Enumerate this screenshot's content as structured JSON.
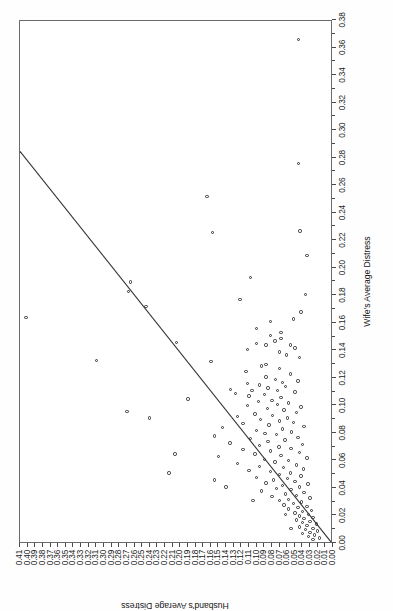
{
  "figure": {
    "background_color": "#ffffff",
    "frame_color": "#6b6b6b",
    "point_color": "#2e2e2e",
    "line_color": "#333333",
    "orientation_note": "chart printed rotated 90 degrees counter-clockwise on portrait page"
  },
  "chart_data": {
    "type": "scatter",
    "title": "",
    "xlabel": "Wife's Average Distress",
    "ylabel": "Husband's Average Distress",
    "xlim": [
      0.0,
      0.38
    ],
    "ylim": [
      0.0,
      0.41
    ],
    "grid": false,
    "legend": null,
    "xticks": [
      "0.00",
      "0.02",
      "0.04",
      "0.06",
      "0.08",
      "0.10",
      "0.12",
      "0.14",
      "0.16",
      "0.18",
      "0.20",
      "0.22",
      "0.24",
      "0.26",
      "0.28",
      "0.30",
      "0.32",
      "0.34",
      "0.36",
      "0.38"
    ],
    "xtick_values": [
      0.0,
      0.02,
      0.04,
      0.06,
      0.08,
      0.1,
      0.12,
      0.14,
      0.16,
      0.18,
      0.2,
      0.22,
      0.24,
      0.26,
      0.28,
      0.3,
      0.32,
      0.34,
      0.36,
      0.38
    ],
    "xtick_minor_values": [
      0.01,
      0.03,
      0.05,
      0.07,
      0.09,
      0.11,
      0.13,
      0.15,
      0.17,
      0.19,
      0.21,
      0.23,
      0.25,
      0.27,
      0.29,
      0.31,
      0.33,
      0.35,
      0.37
    ],
    "yticks": [
      "0.00",
      "0.01",
      "0.02",
      "0.03",
      "0.04",
      "0.05",
      "0.06",
      "0.07",
      "0.08",
      "0.09",
      "0.10",
      "0.11",
      "0.12",
      "0.13",
      "0.14",
      "0.15",
      "0.16",
      "0.17",
      "0.18",
      "0.19",
      "0.20",
      "0.21",
      "0.22",
      "0.23",
      "0.24",
      "0.25",
      "0.26",
      "0.27",
      "0.28",
      "0.29",
      "0.30",
      "0.31",
      "0.32",
      "0.33",
      "0.34",
      "0.35",
      "0.36",
      "0.37",
      "0.38",
      "0.39",
      "0.40",
      "0.41"
    ],
    "ytick_values": [
      0.0,
      0.01,
      0.02,
      0.03,
      0.04,
      0.05,
      0.06,
      0.07,
      0.08,
      0.09,
      0.1,
      0.11,
      0.12,
      0.13,
      0.14,
      0.15,
      0.16,
      0.17,
      0.18,
      0.19,
      0.2,
      0.21,
      0.22,
      0.23,
      0.24,
      0.25,
      0.26,
      0.27,
      0.28,
      0.29,
      0.3,
      0.31,
      0.32,
      0.33,
      0.34,
      0.35,
      0.36,
      0.37,
      0.38,
      0.39,
      0.4,
      0.41
    ],
    "reference_line": {
      "name": "identity-line",
      "description": "straight reference line from lower-left origin to upper region",
      "x0": 0.0,
      "y0": 0.0,
      "x1": 0.285,
      "y1": 0.41
    },
    "marker": {
      "shape": "open-circle",
      "size_px": 3.4,
      "fill": "none",
      "edge": "#2e2e2e"
    },
    "points": [
      [
        0.365,
        0.045
      ],
      [
        0.275,
        0.045
      ],
      [
        0.251,
        0.165
      ],
      [
        0.226,
        0.043
      ],
      [
        0.225,
        0.158
      ],
      [
        0.208,
        0.034
      ],
      [
        0.192,
        0.108
      ],
      [
        0.189,
        0.265
      ],
      [
        0.182,
        0.268
      ],
      [
        0.18,
        0.036
      ],
      [
        0.176,
        0.122
      ],
      [
        0.171,
        0.245
      ],
      [
        0.167,
        0.042
      ],
      [
        0.163,
        0.402
      ],
      [
        0.162,
        0.052
      ],
      [
        0.16,
        0.082
      ],
      [
        0.155,
        0.1
      ],
      [
        0.152,
        0.068
      ],
      [
        0.15,
        0.082
      ],
      [
        0.148,
        0.068
      ],
      [
        0.146,
        0.076
      ],
      [
        0.145,
        0.205
      ],
      [
        0.144,
        0.1
      ],
      [
        0.143,
        0.088
      ],
      [
        0.143,
        0.056
      ],
      [
        0.141,
        0.05
      ],
      [
        0.14,
        0.112
      ],
      [
        0.138,
        0.07
      ],
      [
        0.136,
        0.061
      ],
      [
        0.134,
        0.044
      ],
      [
        0.132,
        0.31
      ],
      [
        0.131,
        0.16
      ],
      [
        0.129,
        0.088
      ],
      [
        0.128,
        0.094
      ],
      [
        0.126,
        0.07
      ],
      [
        0.124,
        0.114
      ],
      [
        0.122,
        0.056
      ],
      [
        0.12,
        0.088
      ],
      [
        0.118,
        0.075
      ],
      [
        0.117,
        0.046
      ],
      [
        0.116,
        0.066
      ],
      [
        0.115,
        0.112
      ],
      [
        0.114,
        0.096
      ],
      [
        0.113,
        0.062
      ],
      [
        0.112,
        0.085
      ],
      [
        0.111,
        0.134
      ],
      [
        0.11,
        0.106
      ],
      [
        0.11,
        0.073
      ],
      [
        0.109,
        0.05
      ],
      [
        0.108,
        0.128
      ],
      [
        0.107,
        0.09
      ],
      [
        0.106,
        0.11
      ],
      [
        0.105,
        0.068
      ],
      [
        0.104,
        0.19
      ],
      [
        0.103,
        0.08
      ],
      [
        0.102,
        0.098
      ],
      [
        0.101,
        0.058
      ],
      [
        0.1,
        0.073
      ],
      [
        0.099,
        0.112
      ],
      [
        0.098,
        0.042
      ],
      [
        0.097,
        0.086
      ],
      [
        0.096,
        0.064
      ],
      [
        0.095,
        0.27
      ],
      [
        0.094,
        0.048
      ],
      [
        0.093,
        0.102
      ],
      [
        0.092,
        0.079
      ],
      [
        0.091,
        0.125
      ],
      [
        0.09,
        0.06
      ],
      [
        0.09,
        0.24
      ],
      [
        0.089,
        0.095
      ],
      [
        0.088,
        0.07
      ],
      [
        0.087,
        0.052
      ],
      [
        0.086,
        0.118
      ],
      [
        0.085,
        0.084
      ],
      [
        0.084,
        0.038
      ],
      [
        0.083,
        0.145
      ],
      [
        0.082,
        0.066
      ],
      [
        0.081,
        0.1
      ],
      [
        0.08,
        0.054
      ],
      [
        0.079,
        0.089
      ],
      [
        0.078,
        0.074
      ],
      [
        0.077,
        0.155
      ],
      [
        0.076,
        0.046
      ],
      [
        0.075,
        0.108
      ],
      [
        0.074,
        0.063
      ],
      [
        0.073,
        0.085
      ],
      [
        0.072,
        0.135
      ],
      [
        0.071,
        0.04
      ],
      [
        0.07,
        0.096
      ],
      [
        0.069,
        0.071
      ],
      [
        0.068,
        0.055
      ],
      [
        0.067,
        0.118
      ],
      [
        0.066,
        0.082
      ],
      [
        0.065,
        0.044
      ],
      [
        0.064,
        0.102
      ],
      [
        0.063,
        0.068
      ],
      [
        0.062,
        0.15
      ],
      [
        0.061,
        0.034
      ],
      [
        0.06,
        0.09
      ],
      [
        0.059,
        0.058
      ],
      [
        0.058,
        0.076
      ],
      [
        0.057,
        0.125
      ],
      [
        0.056,
        0.048
      ],
      [
        0.055,
        0.096
      ],
      [
        0.054,
        0.065
      ],
      [
        0.053,
        0.039
      ],
      [
        0.052,
        0.11
      ],
      [
        0.051,
        0.082
      ],
      [
        0.05,
        0.056
      ],
      [
        0.05,
        0.215
      ],
      [
        0.049,
        0.07
      ],
      [
        0.048,
        0.042
      ],
      [
        0.047,
        0.1
      ],
      [
        0.046,
        0.06
      ],
      [
        0.045,
        0.078
      ],
      [
        0.045,
        0.155
      ],
      [
        0.044,
        0.05
      ],
      [
        0.043,
        0.088
      ],
      [
        0.042,
        0.033
      ],
      [
        0.041,
        0.066
      ],
      [
        0.04,
        0.044
      ],
      [
        0.04,
        0.14
      ],
      [
        0.039,
        0.074
      ],
      [
        0.038,
        0.055
      ],
      [
        0.037,
        0.094
      ],
      [
        0.036,
        0.038
      ],
      [
        0.035,
        0.062
      ],
      [
        0.034,
        0.048
      ],
      [
        0.033,
        0.08
      ],
      [
        0.032,
        0.03
      ],
      [
        0.031,
        0.058
      ],
      [
        0.03,
        0.07
      ],
      [
        0.03,
        0.105
      ],
      [
        0.029,
        0.041
      ],
      [
        0.028,
        0.052
      ],
      [
        0.027,
        0.064
      ],
      [
        0.026,
        0.034
      ],
      [
        0.025,
        0.046
      ],
      [
        0.024,
        0.058
      ],
      [
        0.023,
        0.028
      ],
      [
        0.022,
        0.04
      ],
      [
        0.021,
        0.05
      ],
      [
        0.02,
        0.032
      ],
      [
        0.02,
        0.062
      ],
      [
        0.019,
        0.044
      ],
      [
        0.018,
        0.026
      ],
      [
        0.017,
        0.038
      ],
      [
        0.016,
        0.048
      ],
      [
        0.015,
        0.03
      ],
      [
        0.014,
        0.04
      ],
      [
        0.013,
        0.022
      ],
      [
        0.012,
        0.034
      ],
      [
        0.011,
        0.044
      ],
      [
        0.01,
        0.026
      ],
      [
        0.01,
        0.055
      ],
      [
        0.009,
        0.036
      ],
      [
        0.008,
        0.02
      ],
      [
        0.007,
        0.03
      ],
      [
        0.006,
        0.04
      ],
      [
        0.005,
        0.024
      ],
      [
        0.004,
        0.032
      ],
      [
        0.003,
        0.018
      ],
      [
        0.002,
        0.026
      ],
      [
        0.064,
        0.207
      ]
    ]
  }
}
